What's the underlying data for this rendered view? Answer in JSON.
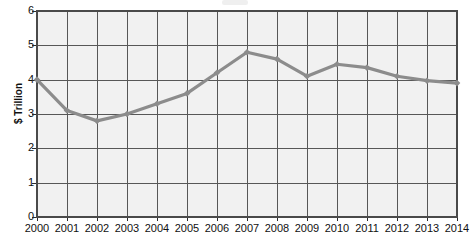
{
  "chart_data": {
    "type": "line",
    "title": "",
    "subtitle": "",
    "xlabel": "",
    "ylabel": "$ Trillion",
    "categories": [
      "2000",
      "2001",
      "2002",
      "2003",
      "2004",
      "2005",
      "2006",
      "2007",
      "2008",
      "2009",
      "2010",
      "2011",
      "2012",
      "2013",
      "2014"
    ],
    "values": [
      4.0,
      3.1,
      2.8,
      3.0,
      3.3,
      3.6,
      4.2,
      4.8,
      4.6,
      4.1,
      4.45,
      4.35,
      4.1,
      3.97,
      3.9
    ],
    "series": [
      {
        "name": "",
        "values": [
          4.0,
          3.1,
          2.8,
          3.0,
          3.3,
          3.6,
          4.2,
          4.8,
          4.6,
          4.1,
          4.45,
          4.35,
          4.1,
          3.97,
          3.9
        ]
      }
    ],
    "ylim": [
      0,
      6
    ],
    "yticks": [
      "0",
      "1",
      "2",
      "3",
      "4",
      "5",
      "6"
    ],
    "ytick_values": [
      0,
      1,
      2,
      3,
      4,
      5,
      6
    ],
    "grid": "both",
    "legend": "none",
    "markers": "diamond",
    "annotations": [],
    "colors": {
      "line": "#8c8c8c",
      "marker": "#8c8c8c",
      "grid": "#575757",
      "plot_background": "#f1f1f1",
      "frame": "#4a4a4a",
      "text": "#111111",
      "page_background": "#ffffff"
    }
  }
}
